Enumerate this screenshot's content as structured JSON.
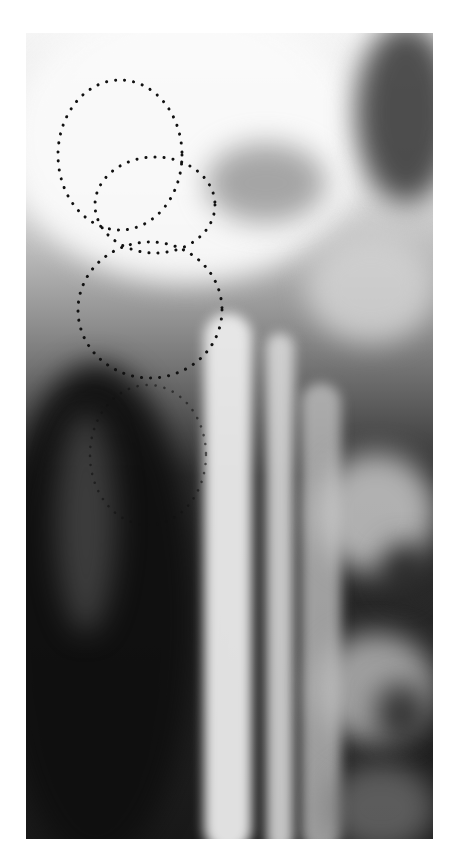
{
  "image": {
    "type": "radiograph",
    "description": "Grayscale X-ray of cervical spine region with dotted outlines marking structures",
    "palette": {
      "background": "#ffffff",
      "dark": "#111111",
      "mid": "#7a7a7a",
      "light": "#eeeeee",
      "dots": "#111111"
    },
    "outlines": [
      {
        "name": "outline-upper",
        "shape": "dotted-ellipse",
        "cx": 120,
        "cy": 155,
        "rx": 62,
        "ry": 75
      },
      {
        "name": "outline-second",
        "shape": "dotted-ellipse",
        "cx": 155,
        "cy": 205,
        "rx": 60,
        "ry": 48
      },
      {
        "name": "outline-third",
        "shape": "dotted-ellipse",
        "cx": 150,
        "cy": 310,
        "rx": 72,
        "ry": 68
      },
      {
        "name": "outline-lower-faint",
        "shape": "dotted-ellipse",
        "cx": 148,
        "cy": 455,
        "rx": 58,
        "ry": 70
      }
    ]
  }
}
